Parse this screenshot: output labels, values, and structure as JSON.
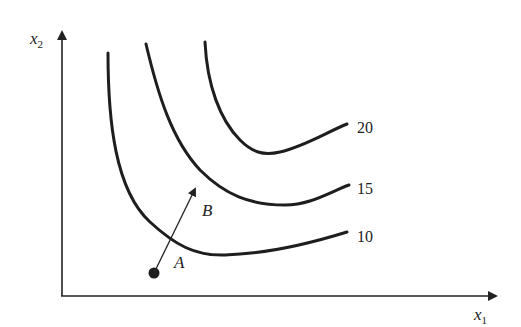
{
  "diagram": {
    "type": "indifference-curves",
    "axes": {
      "x_label": "x",
      "x_sub": "1",
      "y_label": "x",
      "y_sub": "2"
    },
    "curves": [
      {
        "level": "10",
        "label": "10"
      },
      {
        "level": "15",
        "label": "15"
      },
      {
        "level": "20",
        "label": "20"
      }
    ],
    "points": {
      "a_label": "A",
      "b_label": "B"
    },
    "colors": {
      "ink": "#222222",
      "background": "#ffffff"
    }
  }
}
